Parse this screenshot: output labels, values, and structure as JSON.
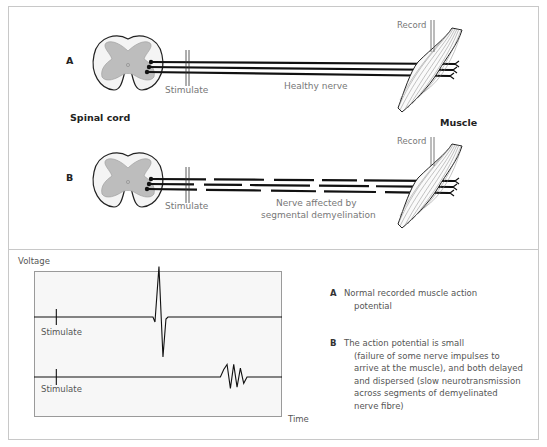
{
  "top_diagram": {
    "panel_a": {
      "label": "A",
      "stimulate_label": "Stimulate",
      "nerve_label": "Healthy nerve",
      "record_label": "Record"
    },
    "spinal_cord_label": "Spinal cord",
    "muscle_label": "Muscle",
    "panel_b": {
      "label": "B",
      "stimulate_label": "Stimulate",
      "nerve_label_line1": "Nerve affected by",
      "nerve_label_line2": "segmental demyelination",
      "record_label": "Record"
    }
  },
  "chart_data": {
    "type": "line",
    "title": "",
    "ylabel": "Voltage",
    "xlabel": "Time",
    "grid": false,
    "series": [
      {
        "name": "A",
        "stimulus_label": "Stimulate",
        "description": "Single sharp biphasic action potential",
        "stimulus_time": 0.09,
        "response_time": 0.52,
        "peak_amplitude": 1.0
      },
      {
        "name": "B",
        "stimulus_label": "Stimulate",
        "description": "Small, delayed, dispersed polyphasic potential",
        "stimulus_time": 0.09,
        "response_time_start": 0.8,
        "response_time_end": 0.98,
        "peak_amplitude": 0.3
      }
    ]
  },
  "legend": {
    "a_key": "A",
    "a_line1": "Normal recorded muscle action",
    "a_line2": "potential",
    "b_key": "B",
    "b_line1": "The action potential is small",
    "b_line2": "(failure of some nerve impulses to",
    "b_line3": "arrive at the muscle), and both delayed",
    "b_line4": "and dispersed (slow neurotransmission",
    "b_line5": "across segments of demyelinated",
    "b_line6": "nerve fibre)"
  }
}
